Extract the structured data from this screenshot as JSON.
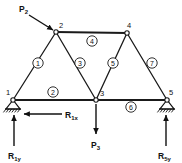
{
  "figure": {
    "type": "truss-free-body-diagram",
    "width": 182,
    "height": 163,
    "background_color": "#ffffff",
    "line_color": "#111111"
  },
  "joints": [
    {
      "id": "1",
      "label": "1",
      "x": 13,
      "y": 100,
      "support": "pin",
      "label_dx": -7,
      "label_dy": -5
    },
    {
      "id": "2",
      "label": "2",
      "x": 56,
      "y": 32,
      "support": "none",
      "label_dx": 3,
      "label_dy": -4
    },
    {
      "id": "3",
      "label": "3",
      "x": 96,
      "y": 100,
      "support": "none",
      "label_dx": 4,
      "label_dy": -4
    },
    {
      "id": "4",
      "label": "4",
      "x": 127,
      "y": 33,
      "support": "none",
      "label_dx": 0,
      "label_dy": -5
    },
    {
      "id": "5",
      "label": "5",
      "x": 167,
      "y": 100,
      "support": "roller",
      "label_dx": 2,
      "label_dy": -5
    }
  ],
  "members": [
    {
      "id": "1",
      "label": "1",
      "from": "1",
      "to": "2",
      "badge_x": 38,
      "badge_y": 63,
      "kind": "web"
    },
    {
      "id": "2",
      "label": "2",
      "from": "1",
      "to": "3",
      "badge_x": 53,
      "badge_y": 92,
      "kind": "chord"
    },
    {
      "id": "3",
      "label": "3",
      "from": "2",
      "to": "3",
      "badge_x": 80,
      "badge_y": 63,
      "kind": "web"
    },
    {
      "id": "4",
      "label": "4",
      "from": "2",
      "to": "4",
      "badge_x": 92,
      "badge_y": 41,
      "kind": "chord"
    },
    {
      "id": "5",
      "label": "5",
      "from": "3",
      "to": "4",
      "badge_x": 113,
      "badge_y": 63,
      "kind": "web"
    },
    {
      "id": "6",
      "label": "6",
      "from": "3",
      "to": "5",
      "badge_x": 131,
      "badge_y": 107,
      "kind": "chord"
    },
    {
      "id": "7",
      "label": "7",
      "from": "4",
      "to": "5",
      "badge_x": 152,
      "badge_y": 63,
      "kind": "web"
    }
  ],
  "loads": [
    {
      "name": "P2",
      "base": "P",
      "sub": "2",
      "applied_at_joint": "2",
      "direction": "down-right-diagonal",
      "tail_x": 29,
      "tail_y": 15,
      "tip_x": 53,
      "tip_y": 30,
      "label_x": 19,
      "label_y": 12
    },
    {
      "name": "P3",
      "base": "P",
      "sub": "3",
      "applied_at_joint": "3",
      "direction": "down",
      "tail_x": 96,
      "tail_y": 104,
      "tip_x": 96,
      "tip_y": 134,
      "label_x": 91,
      "label_y": 148
    }
  ],
  "reactions": [
    {
      "name": "R1x",
      "base": "R",
      "sub": "1x",
      "at_joint": "1",
      "direction": "left",
      "tail_x": 62,
      "tail_y": 114,
      "tip_x": 24,
      "tip_y": 114,
      "label_x": 65,
      "label_y": 118
    },
    {
      "name": "R1y",
      "base": "R",
      "sub": "1y",
      "at_joint": "1",
      "direction": "up",
      "tail_x": 14,
      "tail_y": 146,
      "tip_x": 14,
      "tip_y": 115,
      "label_x": 8,
      "label_y": 159
    },
    {
      "name": "R5y",
      "base": "R",
      "sub": "5y",
      "at_joint": "5",
      "direction": "up",
      "tail_x": 166,
      "tail_y": 146,
      "tip_x": 166,
      "tip_y": 115,
      "label_x": 158,
      "label_y": 159
    }
  ]
}
